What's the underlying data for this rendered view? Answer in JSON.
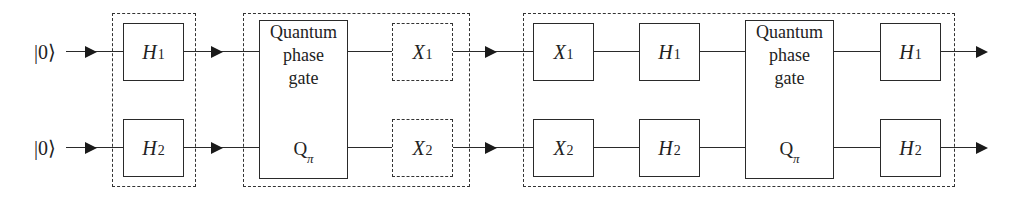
{
  "diagram": {
    "type": "quantum-circuit",
    "qubits": [
      {
        "input_label": "|0⟩"
      },
      {
        "input_label": "|0⟩"
      }
    ],
    "stages": [
      {
        "group": "hadamard-stage",
        "gates": [
          {
            "label": "H",
            "index": "1",
            "qubit": 1,
            "style": "solid"
          },
          {
            "label": "H",
            "index": "2",
            "qubit": 2,
            "style": "solid"
          }
        ]
      },
      {
        "group": "phase-stage",
        "gates": [
          {
            "label_lines": [
              "Quantum",
              "phase",
              "gate"
            ],
            "symbol": "Q",
            "symbol_sub": "π",
            "qubits": [
              1,
              2
            ]
          },
          {
            "label": "X",
            "index": "1",
            "qubit": 1,
            "style": "dashed"
          },
          {
            "label": "X",
            "index": "2",
            "qubit": 2,
            "style": "dashed"
          }
        ]
      },
      {
        "group": "inversion-stage",
        "gates": [
          {
            "label": "X",
            "index": "1",
            "qubit": 1,
            "style": "solid"
          },
          {
            "label": "X",
            "index": "2",
            "qubit": 2,
            "style": "solid"
          },
          {
            "label": "H",
            "index": "1",
            "qubit": 1,
            "style": "solid"
          },
          {
            "label": "H",
            "index": "2",
            "qubit": 2,
            "style": "solid"
          },
          {
            "label_lines": [
              "Quantum",
              "phase",
              "gate"
            ],
            "symbol": "Q",
            "symbol_sub": "π",
            "qubits": [
              1,
              2
            ]
          },
          {
            "label": "H",
            "index": "1",
            "qubit": 1,
            "style": "solid"
          },
          {
            "label": "H",
            "index": "2",
            "qubit": 2,
            "style": "solid"
          }
        ]
      }
    ]
  },
  "labels": {
    "ket0": "|0⟩",
    "H": "H",
    "X": "X",
    "Q": "Q",
    "sub1": "1",
    "sub2": "2",
    "pi": "π",
    "qpg_line1": "Quantum",
    "qpg_line2": "phase",
    "qpg_line3": "gate"
  }
}
